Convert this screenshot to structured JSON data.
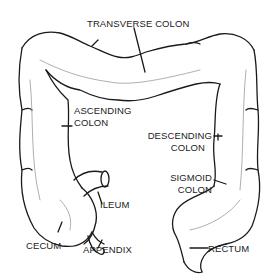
{
  "diagram": {
    "labels": {
      "transverse_colon": "TRANSVERSE COLON",
      "ascending_colon_1": "ASCENDING",
      "ascending_colon_2": "COLON",
      "descending_colon_1": "DESCENDING",
      "descending_colon_2": "COLON",
      "sigmoid_colon_1": "SIGMOID",
      "sigmoid_colon_2": "COLON",
      "ileum": "ILEUM",
      "cecum": "CECUM",
      "appendix": "APPENDIX",
      "rectum": "RECTUM"
    },
    "colors": {
      "outline": "#1a1a1a",
      "shading": "#9a9a9a",
      "background": "#ffffff"
    }
  }
}
